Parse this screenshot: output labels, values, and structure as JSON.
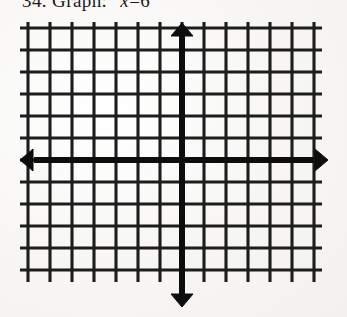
{
  "document": {
    "type": "scanned-worksheet",
    "paper_color": "#f6f5f2",
    "ink_color": "#141414"
  },
  "caption": {
    "number": "34.",
    "instruction": "Graph:",
    "equation_lhs": "x",
    "equation_operator": "=",
    "equation_rhs": "6",
    "full_text": "34. Graph:  x = 6"
  },
  "chart_data": {
    "type": "scatter",
    "title": "",
    "xlabel": "",
    "ylabel": "",
    "grid": true,
    "legend": false,
    "series": [],
    "x": [],
    "y": [],
    "xlim": [
      -7,
      7
    ],
    "ylim": [
      -6,
      6
    ],
    "x_gridlines": 14,
    "y_gridlines": 12,
    "x_axis_row_index": 6,
    "y_axis_column_index": 7,
    "cell_size_px": 22,
    "axes": {
      "x_axis": {
        "name": "x-axis",
        "arrow_left": true,
        "arrow_right": true
      },
      "y_axis": {
        "name": "y-axis",
        "arrow_up": true,
        "arrow_down": true
      }
    },
    "tick_labels": []
  }
}
